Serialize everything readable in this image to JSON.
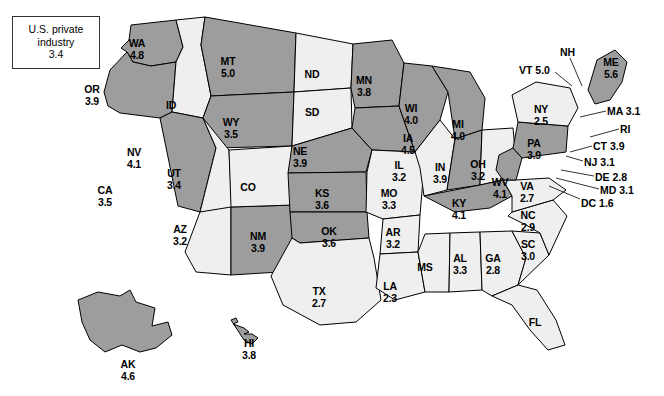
{
  "chart_data": {
    "type": "heatmap",
    "title": "U.S. private industry",
    "subtitle": "",
    "xlabel": "",
    "ylabel": "",
    "legend": {
      "line1": "U.S. private",
      "line2": "industry",
      "value": "3.4"
    },
    "categories": [
      "WA",
      "OR",
      "ID",
      "MT",
      "WY",
      "NV",
      "UT",
      "CA",
      "AZ",
      "NM",
      "CO",
      "ND",
      "SD",
      "NE",
      "KS",
      "OK",
      "TX",
      "MN",
      "IA",
      "MO",
      "AR",
      "LA",
      "WI",
      "IL",
      "MI",
      "IN",
      "OH",
      "KY",
      "TN",
      "MS",
      "AL",
      "GA",
      "FL",
      "SC",
      "NC",
      "VA",
      "WV",
      "PA",
      "NY",
      "VT",
      "NH",
      "ME",
      "MA",
      "RI",
      "CT",
      "NJ",
      "DE",
      "MD",
      "DC",
      "AK",
      "HI"
    ],
    "values": [
      4.8,
      3.9,
      null,
      5.0,
      3.5,
      4.1,
      3.4,
      3.5,
      3.2,
      3.9,
      null,
      null,
      null,
      3.9,
      3.6,
      3.6,
      2.7,
      3.8,
      4.5,
      3.3,
      3.2,
      2.3,
      4.0,
      3.2,
      4.0,
      3.9,
      3.2,
      4.1,
      3.5,
      null,
      3.3,
      2.8,
      null,
      3.0,
      2.9,
      2.7,
      4.1,
      3.9,
      2.5,
      5.0,
      null,
      5.6,
      3.1,
      null,
      3.9,
      3.1,
      2.8,
      3.1,
      1.6,
      4.6,
      3.8
    ],
    "shading": {
      "dark_fill": "#9d9d9d",
      "light_fill": "#efefef",
      "stroke": "#000000"
    },
    "states": [
      {
        "abbr": "WA",
        "value": "4.8",
        "shade": "dark",
        "x": 137,
        "y": 38,
        "w": 34
      },
      {
        "abbr": "OR",
        "value": "3.9",
        "shade": "dark",
        "x": 92,
        "y": 84,
        "w": 34
      },
      {
        "abbr": "ID",
        "value": "",
        "shade": "light",
        "x": 171,
        "y": 100,
        "w": 26
      },
      {
        "abbr": "MT",
        "value": "5.0",
        "shade": "dark",
        "x": 228,
        "y": 56,
        "w": 32
      },
      {
        "abbr": "WY",
        "value": "3.5",
        "shade": "dark",
        "x": 231,
        "y": 117,
        "w": 30
      },
      {
        "abbr": "NV",
        "value": "4.1",
        "shade": "dark",
        "x": 134,
        "y": 147,
        "w": 30
      },
      {
        "abbr": "UT",
        "value": "3.4",
        "shade": "light",
        "x": 174,
        "y": 168,
        "w": 28
      },
      {
        "abbr": "CA",
        "value": "3.5",
        "shade": "dark",
        "x": 105,
        "y": 185,
        "w": 30
      },
      {
        "abbr": "AZ",
        "value": "3.2",
        "shade": "light",
        "x": 180,
        "y": 224,
        "w": 28
      },
      {
        "abbr": "NM",
        "value": "3.9",
        "shade": "dark",
        "x": 258,
        "y": 231,
        "w": 30
      },
      {
        "abbr": "CO",
        "value": "",
        "shade": "light",
        "x": 248,
        "y": 182,
        "w": 28
      },
      {
        "abbr": "ND",
        "value": "",
        "shade": "light",
        "x": 312,
        "y": 69,
        "w": 28
      },
      {
        "abbr": "SD",
        "value": "",
        "shade": "light",
        "x": 312,
        "y": 107,
        "w": 28
      },
      {
        "abbr": "NE",
        "value": "3.9",
        "shade": "dark",
        "x": 300,
        "y": 146,
        "w": 30
      },
      {
        "abbr": "KS",
        "value": "3.6",
        "shade": "dark",
        "x": 322,
        "y": 188,
        "w": 30
      },
      {
        "abbr": "OK",
        "value": "3.6",
        "shade": "dark",
        "x": 329,
        "y": 226,
        "w": 30
      },
      {
        "abbr": "TX",
        "value": "2.7",
        "shade": "light",
        "x": 319,
        "y": 286,
        "w": 28
      },
      {
        "abbr": "MN",
        "value": "3.8",
        "shade": "dark",
        "x": 364,
        "y": 75,
        "w": 30
      },
      {
        "abbr": "IA",
        "value": "4.5",
        "shade": "dark",
        "x": 408,
        "y": 133,
        "w": 28
      },
      {
        "abbr": "MO",
        "value": "3.3",
        "shade": "light",
        "x": 389,
        "y": 188,
        "w": 30
      },
      {
        "abbr": "AR",
        "value": "3.2",
        "shade": "light",
        "x": 393,
        "y": 227,
        "w": 28
      },
      {
        "abbr": "LA",
        "value": "2.3",
        "shade": "light",
        "x": 390,
        "y": 281,
        "w": 28
      },
      {
        "abbr": "WI",
        "value": "4.0",
        "shade": "dark",
        "x": 411,
        "y": 103,
        "w": 28
      },
      {
        "abbr": "IL",
        "value": "3.2",
        "shade": "light",
        "x": 399,
        "y": 160,
        "w": 26
      },
      {
        "abbr": "MI",
        "value": "4.0",
        "shade": "dark",
        "x": 458,
        "y": 119,
        "w": 26
      },
      {
        "abbr": "IN",
        "value": "3.9",
        "shade": "dark",
        "x": 440,
        "y": 162,
        "w": 26
      },
      {
        "abbr": "OH",
        "value": "3.2",
        "shade": "light",
        "x": 478,
        "y": 159,
        "w": 28
      },
      {
        "abbr": "KY",
        "value": "4.1",
        "shade": "dark",
        "x": 459,
        "y": 198,
        "w": 28
      },
      {
        "abbr": "MS",
        "value": "",
        "shade": "light",
        "x": 425,
        "y": 262,
        "w": 28
      },
      {
        "abbr": "AL",
        "value": "3.3",
        "shade": "light",
        "x": 460,
        "y": 253,
        "w": 28
      },
      {
        "abbr": "GA",
        "value": "2.8",
        "shade": "light",
        "x": 493,
        "y": 253,
        "w": 28
      },
      {
        "abbr": "FL",
        "value": "",
        "shade": "light",
        "x": 535,
        "y": 317,
        "w": 26
      },
      {
        "abbr": "SC",
        "value": "3.0",
        "shade": "light",
        "x": 528,
        "y": 239,
        "w": 28
      },
      {
        "abbr": "NC",
        "value": "2.9",
        "shade": "light",
        "x": 528,
        "y": 210,
        "w": 28
      },
      {
        "abbr": "VA",
        "value": "2.7",
        "shade": "light",
        "x": 527,
        "y": 181,
        "w": 28
      },
      {
        "abbr": "WV",
        "value": "4.1",
        "shade": "dark",
        "x": 500,
        "y": 177,
        "w": 28
      },
      {
        "abbr": "PA",
        "value": "3.9",
        "shade": "dark",
        "x": 534,
        "y": 138,
        "w": 28
      },
      {
        "abbr": "NY",
        "value": "2.5",
        "shade": "light",
        "x": 541,
        "y": 104,
        "w": 28
      },
      {
        "abbr": "ME",
        "value": "5.6",
        "shade": "dark",
        "x": 611,
        "y": 57,
        "w": 28
      },
      {
        "abbr": "AK",
        "value": "4.6",
        "shade": "dark",
        "x": 128,
        "y": 359,
        "w": 28
      },
      {
        "abbr": "HI",
        "value": "3.8",
        "shade": "dark",
        "x": 249,
        "y": 338,
        "w": 26
      }
    ],
    "callouts": [
      {
        "abbr": "VT",
        "text": "VT 5.0",
        "x": 519,
        "y": 65,
        "lx1": 555,
        "ly1": 72,
        "lx2": 572,
        "ly2": 86
      },
      {
        "abbr": "NH",
        "text": "NH",
        "x": 560,
        "y": 47,
        "lx1": 570,
        "ly1": 58,
        "lx2": 582,
        "ly2": 86
      },
      {
        "abbr": "MA",
        "text": "MA 3.1",
        "x": 607,
        "y": 106,
        "lx1": 606,
        "ly1": 111,
        "lx2": 580,
        "ly2": 117
      },
      {
        "abbr": "RI",
        "text": "RI",
        "x": 620,
        "y": 124,
        "lx1": 619,
        "ly1": 129,
        "lx2": 590,
        "ly2": 137
      },
      {
        "abbr": "CT",
        "text": "CT 3.9",
        "x": 593,
        "y": 141,
        "lx1": 592,
        "ly1": 146,
        "lx2": 570,
        "ly2": 152
      },
      {
        "abbr": "NJ",
        "text": "NJ 3.1",
        "x": 584,
        "y": 157,
        "lx1": 583,
        "ly1": 161,
        "lx2": 566,
        "ly2": 156
      },
      {
        "abbr": "DE",
        "text": "DE 2.8",
        "x": 595,
        "y": 172,
        "lx1": 594,
        "ly1": 176,
        "lx2": 561,
        "ly2": 170
      },
      {
        "abbr": "MD",
        "text": "MD 3.1",
        "x": 600,
        "y": 185,
        "lx1": 599,
        "ly1": 189,
        "lx2": 556,
        "ly2": 178
      },
      {
        "abbr": "DC",
        "text": "DC 1.6",
        "x": 581,
        "y": 198,
        "lx1": 580,
        "ly1": 199,
        "lx2": 549,
        "ly2": 186
      }
    ]
  }
}
